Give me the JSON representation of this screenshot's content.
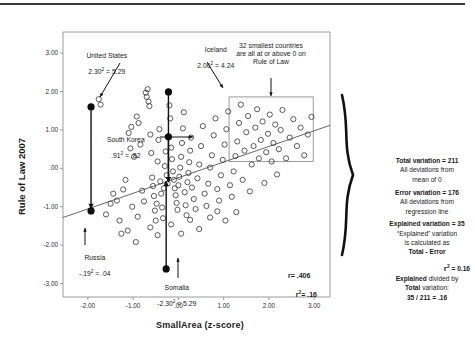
{
  "chart_data": {
    "type": "scatter",
    "title": "",
    "xlabel": "SmallArea (z-score)",
    "ylabel": "Rule of Law 2007",
    "xlim": [
      -2.55,
      3.35
    ],
    "ylim": [
      -3.35,
      3.55
    ],
    "xticks": [
      "-2.00",
      "-1.00",
      ".00",
      "1.00",
      "2.00",
      "3.00"
    ],
    "xtick_values": [
      -2,
      -1,
      0,
      1,
      2,
      3
    ],
    "yticks": [
      "3.00",
      "2.00",
      "1.00",
      ".00",
      "-1.00",
      "-2.00",
      "-3.00"
    ],
    "ytick_values": [
      3,
      2,
      1,
      0,
      -1,
      -2,
      -3
    ],
    "grid": false,
    "legend": "none",
    "regression": {
      "x1": -2.55,
      "y1": -1.28,
      "x2": 3.35,
      "y2": 1.12
    },
    "highlighted_points": [
      {
        "name": "United States",
        "x": -1.93,
        "y": 1.6,
        "residual_label": "2.30² = 5.29",
        "deviation_to_y": -1.07
      },
      {
        "name": "Iceland",
        "x": -0.22,
        "y": 1.99,
        "residual_label": "2.06² = 4.24",
        "deviation_to_y": -0.38
      },
      {
        "name": "South Korea",
        "x": -0.22,
        "y": 0.82,
        "residual_label": ".91² = .82",
        "deviation_to_y": -0.38
      },
      {
        "name": "Russia",
        "x": -1.93,
        "y": -1.11,
        "residual_label": "-.19² = .04",
        "deviation_to_y": -1.07
      },
      {
        "name": "Somalia",
        "x": -0.27,
        "y": -2.62,
        "residual_label": "-2.30² = 5.29",
        "deviation_to_y": -0.4
      }
    ],
    "points": [
      [
        -1.93,
        1.6
      ],
      [
        -1.76,
        1.8
      ],
      [
        -1.72,
        1.66
      ],
      [
        -1.36,
        -0.84
      ],
      [
        -1.3,
        -1.36
      ],
      [
        -1.22,
        -0.55
      ],
      [
        -1.17,
        -0.3
      ],
      [
        -1.12,
        -1.62
      ],
      [
        -1.06,
        0.52
      ],
      [
        -1.02,
        -1.0
      ],
      [
        -0.98,
        0.3
      ],
      [
        -0.92,
        1.35
      ],
      [
        -0.9,
        -1.26
      ],
      [
        -0.88,
        1.18
      ],
      [
        -0.84,
        0.62
      ],
      [
        -0.8,
        -0.58
      ],
      [
        -0.76,
        -0.86
      ],
      [
        -0.72,
        1.97
      ],
      [
        -0.7,
        1.86
      ],
      [
        -0.68,
        2.06
      ],
      [
        -0.66,
        1.74
      ],
      [
        -0.64,
        1.62
      ],
      [
        -0.62,
        0.88
      ],
      [
        -0.6,
        0.4
      ],
      [
        -0.58,
        -0.24
      ],
      [
        -0.56,
        -0.46
      ],
      [
        -0.54,
        -0.72
      ],
      [
        -0.52,
        -1.1
      ],
      [
        -0.5,
        -1.36
      ],
      [
        -0.48,
        -0.92
      ],
      [
        -0.46,
        0.18
      ],
      [
        -0.44,
        0.74
      ],
      [
        -0.42,
        1.02
      ],
      [
        -0.4,
        -0.34
      ],
      [
        -0.38,
        -0.66
      ],
      [
        -0.36,
        -1.02
      ],
      [
        -0.34,
        -1.3
      ],
      [
        -0.32,
        -0.52
      ],
      [
        -0.3,
        0.06
      ],
      [
        -0.28,
        0.44
      ],
      [
        -0.26,
        -0.18
      ],
      [
        -0.24,
        -0.4
      ],
      [
        -0.22,
        1.99
      ],
      [
        -0.22,
        0.82
      ],
      [
        -0.2,
        1.64
      ],
      [
        -0.18,
        1.3
      ],
      [
        -0.16,
        0.54
      ],
      [
        -0.14,
        0.24
      ],
      [
        -0.12,
        -0.08
      ],
      [
        -0.1,
        -0.3
      ],
      [
        -0.08,
        -0.52
      ],
      [
        -0.06,
        -0.7
      ],
      [
        -0.04,
        -0.9
      ],
      [
        -0.02,
        -1.08
      ],
      [
        0.0,
        -0.44
      ],
      [
        0.02,
        -0.22
      ],
      [
        0.04,
        0.02
      ],
      [
        0.06,
        0.3
      ],
      [
        0.08,
        0.66
      ],
      [
        0.1,
        1.04
      ],
      [
        0.12,
        1.46
      ],
      [
        0.14,
        -0.62
      ],
      [
        0.16,
        -0.96
      ],
      [
        0.18,
        -1.22
      ],
      [
        0.2,
        -0.36
      ],
      [
        0.22,
        -0.12
      ],
      [
        0.24,
        0.16
      ],
      [
        0.26,
        0.46
      ],
      [
        0.28,
        0.8
      ],
      [
        0.3,
        -0.5
      ],
      [
        0.34,
        -0.8
      ],
      [
        0.38,
        -1.06
      ],
      [
        0.42,
        -0.26
      ],
      [
        0.46,
        0.1
      ],
      [
        0.5,
        0.58
      ],
      [
        0.54,
        1.1
      ],
      [
        0.58,
        -0.66
      ],
      [
        0.62,
        -0.98
      ],
      [
        0.66,
        -0.4
      ],
      [
        0.7,
        0.02
      ],
      [
        0.74,
        0.34
      ],
      [
        0.78,
        0.86
      ],
      [
        0.82,
        1.3
      ],
      [
        0.86,
        -0.54
      ],
      [
        0.9,
        -0.84
      ],
      [
        0.94,
        -0.18
      ],
      [
        0.98,
        0.22
      ],
      [
        1.02,
        0.62
      ],
      [
        1.06,
        1.02
      ],
      [
        1.1,
        1.48
      ],
      [
        1.14,
        -0.44
      ],
      [
        1.18,
        -0.74
      ],
      [
        1.22,
        -0.08
      ],
      [
        1.26,
        0.32
      ],
      [
        1.3,
        0.7
      ],
      [
        1.34,
        1.18
      ],
      [
        1.38,
        1.66
      ],
      [
        1.42,
        -0.3
      ],
      [
        1.46,
        0.46
      ],
      [
        1.5,
        0.94
      ],
      [
        1.54,
        1.36
      ],
      [
        1.58,
        -0.6
      ],
      [
        1.62,
        0.1
      ],
      [
        1.66,
        0.58
      ],
      [
        1.7,
        1.06
      ],
      [
        1.74,
        1.54
      ],
      [
        1.78,
        0.26
      ],
      [
        1.82,
        0.74
      ],
      [
        1.86,
        1.22
      ],
      [
        1.9,
        -0.38
      ],
      [
        1.94,
        0.42
      ],
      [
        1.98,
        0.9
      ],
      [
        2.02,
        1.4
      ],
      [
        2.06,
        0.18
      ],
      [
        2.1,
        0.66
      ],
      [
        2.14,
        1.14
      ],
      [
        2.18,
        -0.16
      ],
      [
        2.22,
        0.5
      ],
      [
        2.26,
        1.0
      ],
      [
        2.3,
        1.52
      ],
      [
        2.38,
        0.26
      ],
      [
        2.46,
        0.8
      ],
      [
        2.54,
        1.28
      ],
      [
        2.62,
        0.58
      ],
      [
        2.7,
        1.06
      ],
      [
        2.78,
        0.34
      ],
      [
        2.86,
        0.88
      ],
      [
        2.94,
        1.34
      ],
      [
        -1.5,
        -0.92
      ],
      [
        -1.44,
        -0.66
      ],
      [
        -1.6,
        -1.2
      ],
      [
        -1.26,
        -1.7
      ],
      [
        -0.94,
        -1.92
      ],
      [
        -0.62,
        -1.54
      ],
      [
        -0.46,
        -1.74
      ],
      [
        -0.16,
        -1.46
      ],
      [
        0.06,
        -1.7
      ],
      [
        0.26,
        -1.34
      ],
      [
        0.46,
        -1.58
      ],
      [
        0.7,
        -1.28
      ],
      [
        -1.1,
        0.92
      ],
      [
        -1.04,
        1.08
      ],
      [
        0.86,
        -1.12
      ],
      [
        1.04,
        -1.36
      ],
      [
        1.28,
        -1.14
      ]
    ],
    "boxes": [
      {
        "name": "smallest-countries-box",
        "x1": 1.12,
        "y1": 1.86,
        "x2": 2.98,
        "y2": 0.18
      }
    ]
  },
  "annotations": {
    "united_states": {
      "name": "United States",
      "value": "2.30",
      "sup": "2",
      "eq": " = 5.29"
    },
    "iceland": {
      "name": "Iceland",
      "value": "2.06",
      "sup": "2",
      "eq": " = 4.24"
    },
    "south_korea": {
      "name": "South Korea",
      "value": ".91",
      "sup": "2",
      "eq": " = .82"
    },
    "russia": {
      "name": "Russia",
      "value": "-.19",
      "sup": "2",
      "eq": " = .04"
    },
    "somalia": {
      "name": "Somalia",
      "value": "-2.30",
      "sup": "2",
      "eq": " = 5.29"
    },
    "smallest_countries": "32 smallest countries\nare all at or above 0 on\nRule of Law",
    "r_value": "r= .406",
    "r2_value_label": "r",
    "r2_sup": "2",
    "r2_value": "= .16"
  },
  "stats_panel": {
    "total_variation_label": "Total variation",
    "total_variation_value": " = 211",
    "total_variation_desc": "All deviations from\nmean of 0",
    "error_variation_label": "Error variation",
    "error_variation_value": " = 176",
    "error_variation_desc": "All deviations from\nregression line",
    "explained_variation_label": "Explained variation = 35",
    "explained_variation_desc_1": "“Explained” variation",
    "explained_variation_desc_2": "is calculated as",
    "explained_variation_desc_3": "Total - Error",
    "r2_line_label": "r",
    "r2_line_sup": "2",
    "r2_line_value": " =   0.16",
    "r2_desc_1_bold": "Explained",
    "r2_desc_1_rest": " divided by",
    "r2_desc_2_bold": "Total",
    "r2_desc_2_rest": " variation:",
    "r2_desc_3": "35 / 211 = .16"
  },
  "colors": {
    "point_stroke": "#3d3d3d",
    "highlight_fill": "#0d0d0d",
    "axis": "#8a8a8a",
    "text": "#1b1b1b",
    "box_stroke": "#9a9a9a"
  }
}
